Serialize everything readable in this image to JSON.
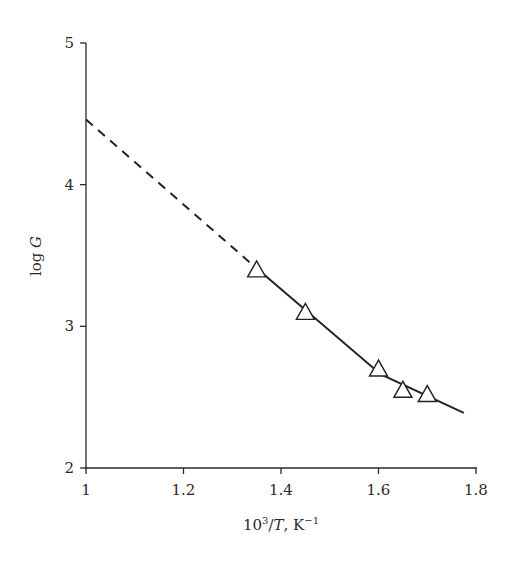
{
  "chart_data": {
    "type": "scatter",
    "title": "",
    "xlabel": {
      "prefix": "10",
      "sup": "3",
      "slash": "/",
      "var": "T",
      "unit": ", K",
      "unit_sup": "−1"
    },
    "ylabel": {
      "text": "log ",
      "var": "G"
    },
    "xlim": [
      1.0,
      1.8
    ],
    "ylim": [
      2,
      5
    ],
    "xticks": [
      1.0,
      1.2,
      1.4,
      1.6,
      1.8
    ],
    "xtick_labels": [
      "1",
      "1.2",
      "1.4",
      "1.6",
      "1.8"
    ],
    "yticks": [
      2,
      3,
      4,
      5
    ],
    "ytick_labels": [
      "2",
      "3",
      "4",
      "5"
    ],
    "grid": false,
    "legend": null,
    "series": [
      {
        "name": "measured",
        "marker": "open-triangle",
        "x": [
          1.35,
          1.45,
          1.6,
          1.65,
          1.7
        ],
        "y": [
          3.4,
          3.1,
          2.7,
          2.55,
          2.52
        ]
      }
    ],
    "lines": [
      {
        "name": "extrapolation",
        "style": "dashed",
        "x": [
          1.0,
          1.35
        ],
        "y": [
          4.46,
          3.41
        ]
      },
      {
        "name": "fit",
        "style": "solid",
        "x": [
          1.35,
          1.605,
          1.775
        ],
        "y": [
          3.41,
          2.66,
          2.39
        ]
      }
    ]
  }
}
